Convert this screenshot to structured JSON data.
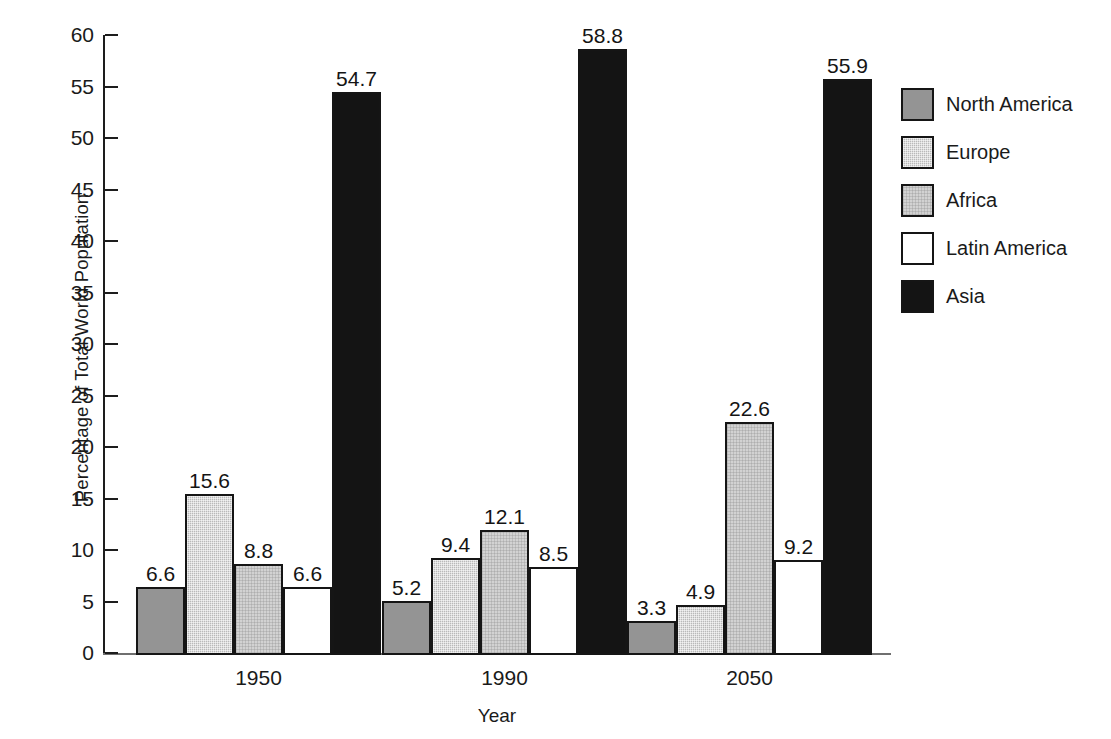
{
  "chart_data": {
    "type": "bar",
    "title": "",
    "xlabel": "Year",
    "ylabel": "Percentage of Total World Population",
    "categories": [
      "1950",
      "1990",
      "2050"
    ],
    "ylim": [
      0,
      60
    ],
    "ytick_values": [
      0,
      5,
      10,
      15,
      20,
      25,
      30,
      35,
      40,
      45,
      50,
      55,
      60
    ],
    "ytick_labels": [
      "0",
      "5",
      "10",
      "15",
      "20",
      "25",
      "30",
      "35",
      "40",
      "45",
      "50",
      "55",
      "60"
    ],
    "grid": false,
    "legend_position": "right",
    "value_labels": true,
    "series": [
      {
        "name": "North America",
        "color": "#949494",
        "fill": "solid-medium-gray",
        "values": [
          6.6,
          5.2,
          3.3
        ],
        "value_labels": [
          "6.6",
          "5.2",
          "3.3"
        ]
      },
      {
        "name": "Europe",
        "color": "#b9b9b9",
        "fill": "checkered-gray",
        "values": [
          15.6,
          9.4,
          4.9
        ],
        "value_labels": [
          "15.6",
          "9.4",
          "4.9"
        ]
      },
      {
        "name": "Africa",
        "color": "#d2d2d2",
        "fill": "stippled-light-gray",
        "values": [
          8.8,
          12.1,
          22.6
        ],
        "value_labels": [
          "8.8",
          "12.1",
          "22.6"
        ]
      },
      {
        "name": "Latin America",
        "color": "#ffffff",
        "fill": "white",
        "values": [
          6.6,
          8.5,
          9.2
        ],
        "value_labels": [
          "6.6",
          "8.5",
          "9.2"
        ]
      },
      {
        "name": "Asia",
        "color": "#141414",
        "fill": "solid-black",
        "values": [
          54.7,
          58.8,
          55.9
        ],
        "value_labels": [
          "54.7",
          "58.8",
          "55.9"
        ]
      }
    ]
  },
  "legend": {
    "items": [
      {
        "label": "North America",
        "swatch_class": "fill-north-america"
      },
      {
        "label": "Europe",
        "swatch_class": "fill-europe"
      },
      {
        "label": "Africa",
        "swatch_class": "fill-africa"
      },
      {
        "label": "Latin America",
        "swatch_class": "fill-latin-america"
      },
      {
        "label": "Asia",
        "swatch_class": "fill-asia"
      }
    ]
  },
  "colors": {
    "axis": "#1d1d1d",
    "text": "#1a1a1a",
    "background": "#ffffff",
    "bar_outline": "#151515"
  }
}
